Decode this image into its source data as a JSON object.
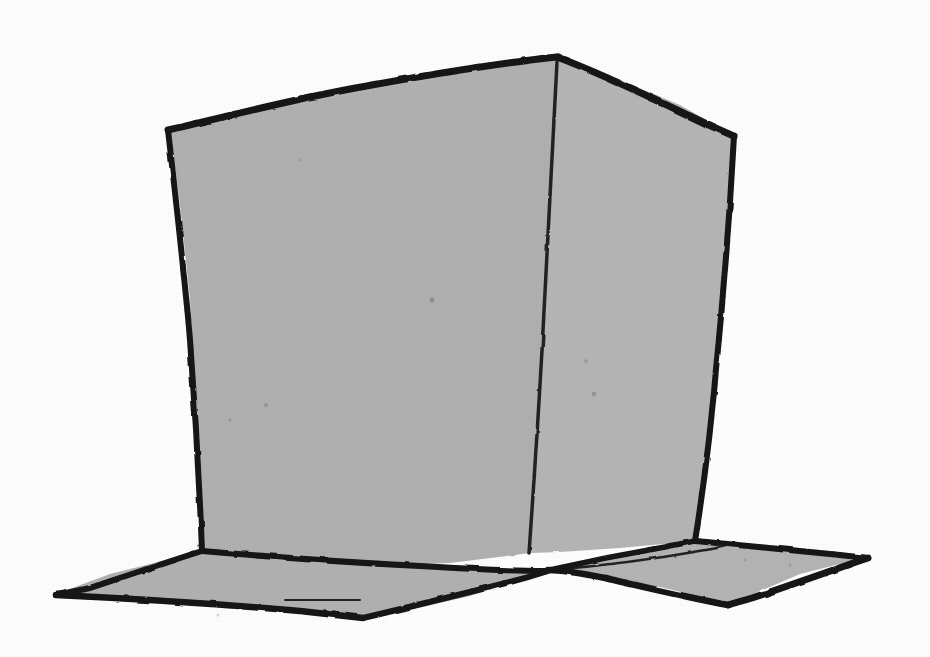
{
  "artwork": {
    "title": "Hand-drawn cube",
    "subject": "cube",
    "medium": "ink line drawing with gray wash",
    "style": "freehand sketch",
    "caption": "",
    "background_color": "#ffffff",
    "fill_color": "#b2b2b2",
    "fill_color_secondary": "#b6b6b6",
    "line_color": "#141414",
    "interior_line_color": "#232323",
    "canvas": {
      "width": 930,
      "height": 657
    }
  },
  "shapes": {
    "top_face": {
      "name": "top-face",
      "label": "Top face",
      "fill": "#b4b4b4",
      "path": "M 170 129 L 280 101 L 400 80 L 500 66 L 557 57 L 620 80 L 680 105 L 733 135 L 700 160 L 560 140 L 420 150 L 280 160 L 190 175 Z"
    },
    "left_face": {
      "name": "left-front-face",
      "label": "Left front face",
      "fill": "#b1b1b1",
      "path": "M 170 129 L 557 57 L 553 120 L 548 230 L 542 350 L 536 460 L 530 553 L 450 563 L 340 567 L 250 556 L 202 551 L 197 430 L 190 300 L 180 205 Z"
    },
    "right_face": {
      "name": "right-front-face",
      "label": "Right front face",
      "fill": "#b6b6b6",
      "path": "M 557 57 L 733 135 L 726 240 L 719 340 L 710 440 L 695 541 L 620 548 L 560 552 L 530 553 L 536 460 L 542 350 L 548 230 L 553 120 Z"
    },
    "left_flap": {
      "name": "left-ground-flap",
      "label": "Left ground flap",
      "fill": "#b2b2b2",
      "path": "M 202 551 L 300 560 L 400 566 L 470 570 L 545 571 L 470 596 L 400 612 L 363 618 L 270 606 L 160 599 L 56 594 L 110 574 Z"
    },
    "right_flap": {
      "name": "right-ground-flap",
      "label": "Right ground flap",
      "fill": "#b5b5b5",
      "path": "M 695 541 L 770 545 L 830 551 L 868 557 L 800 574 L 730 604 L 660 587 L 600 576 L 548 570 L 600 560 Z"
    }
  },
  "strokes": {
    "top_left_edge": {
      "name": "top-left-edge",
      "label": "Top left edge",
      "path": "M 168 130 C 220 118, 290 100, 350 89 C 420 76, 500 63, 557 57",
      "width": 7
    },
    "top_right_edge": {
      "name": "top-right-edge",
      "label": "Top right edge",
      "path": "M 557 57 C 600 73, 650 97, 690 116 C 712 127, 727 133, 734 136",
      "width": 7
    },
    "left_vertical_edge": {
      "name": "left-vertical-edge",
      "label": "Left vertical edge",
      "path": "M 168 130 C 176 200, 184 270, 190 340 C 196 420, 200 500, 202 551",
      "width": 6
    },
    "right_vertical_edge": {
      "name": "right-vertical-edge",
      "label": "Right vertical edge",
      "path": "M 734 136 C 730 210, 724 290, 716 370 C 709 450, 700 510, 695 541",
      "width": 6
    },
    "center_vertical_edge": {
      "name": "center-vertical-edge",
      "label": "Center vertical edge",
      "path": "M 557 62 C 553 150, 548 250, 542 350 C 537 440, 532 510, 529 553",
      "width": 3.5
    },
    "left_bottom_edge": {
      "name": "left-bottom-edge",
      "label": "Left face bottom edge",
      "path": "M 202 551 C 260 556, 340 562, 420 566 C 470 569, 510 571, 545 571",
      "width": 6
    },
    "right_bottom_edge": {
      "name": "right-bottom-edge",
      "label": "Right face bottom edge",
      "path": "M 545 571 C 580 563, 630 553, 665 547 C 680 544, 690 542, 696 541",
      "width": 5.5
    },
    "left_flap_outer_top": {
      "name": "left-flap-outer-top-edge",
      "label": "Left flap outer top edge",
      "path": "M 202 551 C 170 561, 120 578, 90 588 C 72 592, 62 594, 56 595",
      "width": 6
    },
    "left_flap_outer_bottom": {
      "name": "left-flap-outer-bottom-edge",
      "label": "Left flap outer bottom edge",
      "path": "M 56 595 C 120 598, 220 604, 300 611 C 335 615, 355 617, 363 618",
      "width": 6.5
    },
    "left_flap_inner_bottom": {
      "name": "left-flap-inner-bottom-edge",
      "label": "Left flap inner bottom edge",
      "path": "M 363 618 C 410 607, 470 592, 510 582 C 530 577, 542 573, 548 571",
      "width": 6
    },
    "right_flap_outer_top": {
      "name": "right-flap-outer-top-edge",
      "label": "Right flap outer top edge",
      "path": "M 696 541 C 740 545, 800 551, 840 555 C 856 557, 864 557, 868 558",
      "width": 6
    },
    "right_flap_outer_bottom": {
      "name": "right-flap-outer-bottom-edge",
      "label": "Right flap outer bottom edge",
      "path": "M 868 558 C 830 571, 780 589, 752 598 C 738 602, 731 604, 728 605",
      "width": 7
    },
    "right_flap_inner_bottom": {
      "name": "right-flap-inner-bottom-edge",
      "label": "Right flap inner bottom edge",
      "path": "M 728 605 C 690 598, 640 586, 605 578 C 575 572, 556 570, 548 570",
      "width": 6.5
    },
    "right_flap_crease": {
      "name": "right-flap-crease-line",
      "label": "Right flap crease line",
      "path": "M 551 570 C 600 566, 660 558, 700 551 C 720 548, 730 545, 736 543",
      "width": 2.5
    },
    "left_flap_crease": {
      "name": "left-flap-crease-line",
      "label": "Left flap crease line",
      "path": "M 285 600 C 310 600, 340 600, 360 600",
      "width": 2
    }
  },
  "speckles": [
    {
      "name": "paper-speckle",
      "cx": 432,
      "cy": 300,
      "r": 2.4,
      "opacity": 0.22
    },
    {
      "name": "paper-speckle",
      "cx": 266,
      "cy": 405,
      "r": 1.9,
      "opacity": 0.18
    },
    {
      "name": "paper-speckle",
      "cx": 230,
      "cy": 420,
      "r": 1.4,
      "opacity": 0.14
    },
    {
      "name": "paper-speckle",
      "cx": 586,
      "cy": 361,
      "r": 1.8,
      "opacity": 0.17
    },
    {
      "name": "paper-speckle",
      "cx": 594,
      "cy": 394,
      "r": 2.2,
      "opacity": 0.2
    },
    {
      "name": "paper-speckle",
      "cx": 218,
      "cy": 615,
      "r": 1.6,
      "opacity": 0.16
    },
    {
      "name": "paper-speckle",
      "cx": 790,
      "cy": 565,
      "r": 1.5,
      "opacity": 0.15
    },
    {
      "name": "paper-speckle",
      "cx": 745,
      "cy": 560,
      "r": 1.3,
      "opacity": 0.13
    },
    {
      "name": "paper-speckle",
      "cx": 660,
      "cy": 556,
      "r": 1.4,
      "opacity": 0.14
    },
    {
      "name": "paper-speckle",
      "cx": 300,
      "cy": 160,
      "r": 1.3,
      "opacity": 0.12
    }
  ]
}
